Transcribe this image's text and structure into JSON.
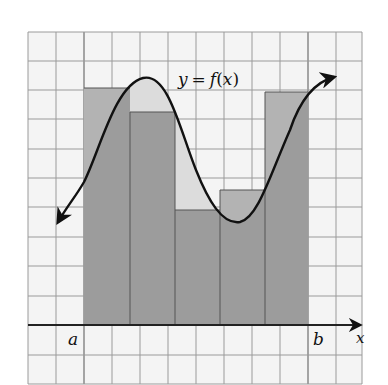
{
  "diagram": {
    "type": "riemann-sum-illustration",
    "curve_label": "y = f(x)",
    "curve_label_parts": {
      "y": "y",
      "eq": "=",
      "f": "f",
      "lparen": "(",
      "x": "x",
      "rparen": ")"
    },
    "axis_label_x": "x",
    "interval_start_label": "a",
    "interval_end_label": "b",
    "grid": {
      "columns": 12,
      "rows": 12,
      "cell_px": 28
    },
    "rectangles": [
      {
        "index": 1,
        "x_left": 84,
        "x_right": 130,
        "top": 88
      },
      {
        "index": 2,
        "x_left": 130,
        "x_right": 175,
        "top": 112
      },
      {
        "index": 3,
        "x_left": 175,
        "x_right": 220,
        "top": 210
      },
      {
        "index": 4,
        "x_left": 220,
        "x_right": 265,
        "top": 190
      },
      {
        "index": 5,
        "x_left": 265,
        "x_right": 308,
        "top": 92
      }
    ],
    "colors": {
      "background": "#f4f4f4",
      "grid_line": "#8a8a8a",
      "grid_line_major": "#555555",
      "under_curve": "#d9d9d9",
      "rectangle": "#9c9c9c",
      "rectangle_over_curve": "#b3b3b3",
      "curve": "#111111",
      "axis": "#222222"
    }
  }
}
